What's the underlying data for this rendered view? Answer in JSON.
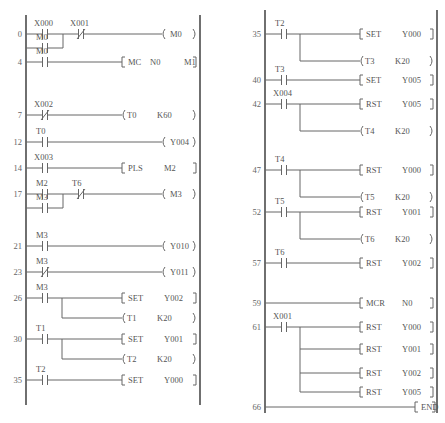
{
  "diagram": {
    "type": "PLC ladder diagram",
    "left": {
      "rungs": [
        {
          "step": "0",
          "contacts": [
            {
              "label": "X000",
              "type": "NO"
            },
            {
              "label": "X001",
              "type": "NC"
            }
          ],
          "parallel": [
            {
              "label": "M0",
              "type": "NO"
            }
          ],
          "outputs": [
            {
              "kind": "coil",
              "text": "M0"
            }
          ]
        },
        {
          "step": "4",
          "contacts": [
            {
              "label": "M0",
              "type": "NO"
            }
          ],
          "outputs": [
            {
              "kind": "instr",
              "op": "MC",
              "args": [
                "N0",
                "M1"
              ]
            }
          ]
        },
        {
          "step": "7",
          "contacts": [
            {
              "label": "X002",
              "type": "NC"
            }
          ],
          "outputs": [
            {
              "kind": "timer",
              "op": "T0",
              "args": [
                "K60"
              ]
            }
          ]
        },
        {
          "step": "12",
          "contacts": [
            {
              "label": "T0",
              "type": "NO"
            }
          ],
          "outputs": [
            {
              "kind": "coil",
              "text": "Y004"
            }
          ]
        },
        {
          "step": "14",
          "contacts": [
            {
              "label": "X003",
              "type": "NO"
            }
          ],
          "outputs": [
            {
              "kind": "instr",
              "op": "PLS",
              "args": [
                "M2"
              ]
            }
          ]
        },
        {
          "step": "17",
          "contacts": [
            {
              "label": "M2",
              "type": "NO"
            },
            {
              "label": "T6",
              "type": "NC"
            }
          ],
          "parallel": [
            {
              "label": "M3",
              "type": "NO"
            }
          ],
          "outputs": [
            {
              "kind": "coil",
              "text": "M3"
            }
          ]
        },
        {
          "step": "21",
          "contacts": [
            {
              "label": "M3",
              "type": "NO"
            }
          ],
          "outputs": [
            {
              "kind": "coil",
              "text": "Y010"
            }
          ]
        },
        {
          "step": "23",
          "contacts": [
            {
              "label": "M3",
              "type": "NC"
            }
          ],
          "outputs": [
            {
              "kind": "coil",
              "text": "Y011"
            }
          ]
        },
        {
          "step": "26",
          "contacts": [
            {
              "label": "M3",
              "type": "NO"
            }
          ],
          "outputs": [
            {
              "kind": "instr",
              "op": "SET",
              "args": [
                "Y002"
              ]
            },
            {
              "kind": "timer",
              "op": "T1",
              "args": [
                "K20"
              ]
            }
          ]
        },
        {
          "step": "30",
          "contacts": [
            {
              "label": "T1",
              "type": "NO"
            }
          ],
          "outputs": [
            {
              "kind": "instr",
              "op": "SET",
              "args": [
                "Y001"
              ]
            },
            {
              "kind": "timer",
              "op": "T2",
              "args": [
                "K20"
              ]
            }
          ]
        },
        {
          "step": "35",
          "contacts": [
            {
              "label": "T2",
              "type": "NO"
            }
          ],
          "outputs": [
            {
              "kind": "instr",
              "op": "SET",
              "args": [
                "Y000"
              ]
            }
          ]
        }
      ]
    },
    "right": {
      "rungs": [
        {
          "step": "35",
          "contacts": [
            {
              "label": "T2",
              "type": "NO"
            }
          ],
          "outputs": [
            {
              "kind": "instr",
              "op": "SET",
              "args": [
                "Y000"
              ]
            },
            {
              "kind": "timer",
              "op": "T3",
              "args": [
                "K20"
              ]
            }
          ]
        },
        {
          "step": "40",
          "contacts": [
            {
              "label": "T3",
              "type": "NO"
            }
          ],
          "outputs": [
            {
              "kind": "instr",
              "op": "SET",
              "args": [
                "Y005"
              ]
            }
          ]
        },
        {
          "step": "42",
          "contacts": [
            {
              "label": "X004",
              "type": "NO"
            }
          ],
          "outputs": [
            {
              "kind": "instr",
              "op": "RST",
              "args": [
                "Y005"
              ]
            },
            {
              "kind": "timer",
              "op": "T4",
              "args": [
                "K20"
              ]
            }
          ]
        },
        {
          "step": "47",
          "contacts": [
            {
              "label": "T4",
              "type": "NO"
            }
          ],
          "outputs": [
            {
              "kind": "instr",
              "op": "RST",
              "args": [
                "Y000"
              ]
            },
            {
              "kind": "timer",
              "op": "T5",
              "args": [
                "K20"
              ]
            }
          ]
        },
        {
          "step": "52",
          "contacts": [
            {
              "label": "T5",
              "type": "NO"
            }
          ],
          "outputs": [
            {
              "kind": "instr",
              "op": "RST",
              "args": [
                "Y001"
              ]
            },
            {
              "kind": "timer",
              "op": "T6",
              "args": [
                "K20"
              ]
            }
          ]
        },
        {
          "step": "57",
          "contacts": [
            {
              "label": "T6",
              "type": "NO"
            }
          ],
          "outputs": [
            {
              "kind": "instr",
              "op": "RST",
              "args": [
                "Y002"
              ]
            }
          ]
        },
        {
          "step": "59",
          "contacts": [],
          "outputs": [
            {
              "kind": "instr",
              "op": "MCR",
              "args": [
                "N0"
              ]
            }
          ]
        },
        {
          "step": "61",
          "contacts": [
            {
              "label": "X001",
              "type": "NO"
            }
          ],
          "outputs": [
            {
              "kind": "instr",
              "op": "RST",
              "args": [
                "Y000"
              ]
            },
            {
              "kind": "instr",
              "op": "RST",
              "args": [
                "Y001"
              ]
            },
            {
              "kind": "instr",
              "op": "RST",
              "args": [
                "Y002"
              ]
            },
            {
              "kind": "instr",
              "op": "RST",
              "args": [
                "Y005"
              ]
            }
          ]
        },
        {
          "step": "66",
          "contacts": [],
          "outputs": [
            {
              "kind": "instr",
              "op": "END",
              "args": []
            }
          ]
        }
      ]
    }
  }
}
